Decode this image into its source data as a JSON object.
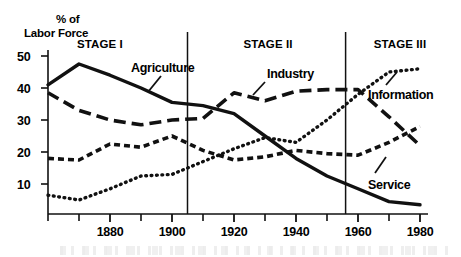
{
  "chart_data": {
    "type": "line",
    "title": "",
    "xlabel": "",
    "ylabel": "% of Labor Force",
    "ylim": [
      0,
      52
    ],
    "xlim": [
      1860,
      1980
    ],
    "grid": false,
    "legend_position": "inline-annotations",
    "x_tick_labels": [
      "1880",
      "1900",
      "1920",
      "1940",
      "1960",
      "1980"
    ],
    "x_tick_values": [
      1880,
      1900,
      1920,
      1940,
      1960,
      1980
    ],
    "x_minor_tick_values": [
      1860,
      1870,
      1890,
      1910,
      1930,
      1950,
      1970
    ],
    "y_tick_labels": [
      "50",
      "40",
      "30",
      "20",
      "10"
    ],
    "y_tick_values": [
      50,
      40,
      30,
      20,
      10
    ],
    "x": [
      1860,
      1870,
      1880,
      1890,
      1900,
      1910,
      1920,
      1930,
      1940,
      1950,
      1960,
      1970,
      1980
    ],
    "series": [
      {
        "name": "Agriculture",
        "style": "solid",
        "values": [
          41,
          47.5,
          44,
          40,
          35.5,
          34.5,
          32,
          25,
          18,
          12.5,
          8.5,
          4.5,
          3.5
        ]
      },
      {
        "name": "Industry",
        "style": "long-dash",
        "values": [
          38.5,
          33,
          30,
          28.5,
          30,
          30.5,
          38.5,
          36,
          39,
          39.5,
          39.5,
          31,
          22
        ]
      },
      {
        "name": "Service",
        "style": "short-dash",
        "values": [
          18,
          17.5,
          22.5,
          21.5,
          25,
          20.5,
          17.5,
          18.5,
          20.5,
          19.5,
          19,
          23,
          28
        ]
      },
      {
        "name": "Information",
        "style": "dotted",
        "values": [
          6.5,
          5,
          8.5,
          12.5,
          13,
          17,
          21,
          24.5,
          23,
          30,
          38,
          45,
          46
        ]
      }
    ],
    "stages": [
      {
        "label": "STAGE I",
        "start": 1860,
        "end": 1905
      },
      {
        "label": "STAGE II",
        "start": 1905,
        "end": 1956
      },
      {
        "label": "STAGE III",
        "start": 1956,
        "end": 1980
      }
    ],
    "stage_divider_values": [
      1905,
      1956
    ],
    "annotations": [
      {
        "text": "Agriculture",
        "series": "Agriculture"
      },
      {
        "text": "Industry",
        "series": "Industry"
      },
      {
        "text": "Information",
        "series": "Information"
      },
      {
        "text": "Service",
        "series": "Service"
      }
    ],
    "colors": {
      "line": "#111111",
      "axis": "#111111",
      "background": "#ffffff"
    }
  },
  "axis": {
    "title_line1": "% of",
    "title_line2": "Labor Force"
  },
  "stage_labels": {
    "stage1": "STAGE I",
    "stage2": "STAGE II",
    "stage3": "STAGE III"
  },
  "series_labels": {
    "agriculture": "Agriculture",
    "industry": "Industry",
    "information": "Information",
    "service": "Service"
  },
  "y_ticks": {
    "t50": "50",
    "t40": "40",
    "t30": "30",
    "t20": "20",
    "t10": "10"
  },
  "x_ticks": {
    "t1880": "1880",
    "t1900": "1900",
    "t1920": "1920",
    "t1940": "1940",
    "t1960": "1960",
    "t1980": "1980"
  }
}
